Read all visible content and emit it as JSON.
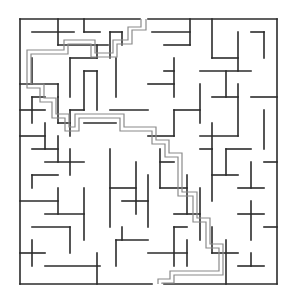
{
  "maze": {
    "colors": {
      "wall": "#2b2b2b",
      "solution_path": "#8a8a8a",
      "background": "#ffffff"
    },
    "bounds": {
      "left": 20,
      "top": 19,
      "right": 277,
      "bottom": 284
    },
    "entrance": {
      "side": "top",
      "x": 144
    },
    "exit": {
      "side": "bottom",
      "x": 158
    },
    "walls": [
      [
        20,
        19,
        140,
        19
      ],
      [
        148,
        19,
        277,
        19
      ],
      [
        20,
        19,
        20,
        284
      ],
      [
        277,
        19,
        277,
        284
      ],
      [
        20,
        284,
        152,
        284
      ],
      [
        164,
        284,
        277,
        284
      ],
      [
        32,
        32,
        74,
        32
      ],
      [
        58,
        19,
        58,
        45
      ],
      [
        84,
        19,
        84,
        32
      ],
      [
        84,
        32,
        100,
        32
      ],
      [
        110,
        32,
        110,
        58
      ],
      [
        110,
        32,
        122,
        32
      ],
      [
        122,
        32,
        122,
        45
      ],
      [
        58,
        45,
        108,
        45
      ],
      [
        97,
        45,
        97,
        58
      ],
      [
        70,
        58,
        97,
        58
      ],
      [
        70,
        58,
        70,
        97
      ],
      [
        20,
        84,
        58,
        84
      ],
      [
        58,
        84,
        58,
        97
      ],
      [
        32,
        58,
        32,
        84
      ],
      [
        84,
        71,
        84,
        110
      ],
      [
        84,
        71,
        97,
        71
      ],
      [
        97,
        71,
        97,
        110
      ],
      [
        116,
        58,
        116,
        97
      ],
      [
        20,
        110,
        45,
        110
      ],
      [
        32,
        97,
        45,
        97
      ],
      [
        32,
        97,
        32,
        123
      ],
      [
        58,
        97,
        58,
        123
      ],
      [
        58,
        123,
        70,
        123
      ],
      [
        70,
        110,
        70,
        136
      ],
      [
        70,
        110,
        84,
        110
      ],
      [
        45,
        123,
        45,
        149
      ],
      [
        20,
        136,
        45,
        136
      ],
      [
        32,
        149,
        58,
        149
      ],
      [
        58,
        136,
        58,
        162
      ],
      [
        84,
        123,
        116,
        123
      ],
      [
        110,
        110,
        148,
        110
      ],
      [
        45,
        162,
        84,
        162
      ],
      [
        70,
        149,
        70,
        175
      ],
      [
        32,
        175,
        58,
        175
      ],
      [
        32,
        175,
        32,
        188
      ],
      [
        20,
        201,
        58,
        201
      ],
      [
        58,
        188,
        58,
        214
      ],
      [
        45,
        214,
        84,
        214
      ],
      [
        84,
        188,
        84,
        240
      ],
      [
        32,
        227,
        70,
        227
      ],
      [
        70,
        227,
        70,
        253
      ],
      [
        20,
        253,
        45,
        253
      ],
      [
        32,
        240,
        32,
        266
      ],
      [
        45,
        266,
        100,
        266
      ],
      [
        97,
        253,
        97,
        284
      ],
      [
        116,
        240,
        116,
        266
      ],
      [
        116,
        240,
        148,
        240
      ],
      [
        122,
        227,
        122,
        240
      ],
      [
        110,
        149,
        110,
        227
      ],
      [
        110,
        188,
        136,
        188
      ],
      [
        136,
        162,
        136,
        214
      ],
      [
        122,
        201,
        148,
        201
      ],
      [
        148,
        175,
        148,
        227
      ],
      [
        160,
        162,
        174,
        162
      ],
      [
        160,
        149,
        160,
        188
      ],
      [
        160,
        188,
        187,
        188
      ],
      [
        187,
        175,
        187,
        214
      ],
      [
        174,
        214,
        200,
        214
      ],
      [
        200,
        188,
        200,
        240
      ],
      [
        174,
        227,
        187,
        227
      ],
      [
        174,
        227,
        174,
        266
      ],
      [
        148,
        253,
        187,
        253
      ],
      [
        187,
        240,
        187,
        266
      ],
      [
        212,
        227,
        212,
        253
      ],
      [
        212,
        253,
        238,
        253
      ],
      [
        226,
        240,
        226,
        284
      ],
      [
        238,
        214,
        264,
        214
      ],
      [
        251,
        201,
        251,
        240
      ],
      [
        264,
        227,
        277,
        227
      ],
      [
        238,
        266,
        264,
        266
      ],
      [
        251,
        253,
        251,
        266
      ],
      [
        152,
        32,
        190,
        32
      ],
      [
        190,
        19,
        190,
        45
      ],
      [
        164,
        45,
        190,
        45
      ],
      [
        212,
        19,
        212,
        58
      ],
      [
        212,
        58,
        238,
        58
      ],
      [
        238,
        32,
        238,
        71
      ],
      [
        251,
        32,
        264,
        32
      ],
      [
        264,
        32,
        264,
        58
      ],
      [
        200,
        71,
        251,
        71
      ],
      [
        226,
        71,
        226,
        97
      ],
      [
        164,
        71,
        174,
        71
      ],
      [
        174,
        58,
        174,
        97
      ],
      [
        148,
        84,
        174,
        84
      ],
      [
        200,
        84,
        200,
        123
      ],
      [
        212,
        97,
        238,
        97
      ],
      [
        238,
        84,
        238,
        136
      ],
      [
        251,
        97,
        277,
        97
      ],
      [
        264,
        110,
        264,
        149
      ],
      [
        200,
        136,
        238,
        136
      ],
      [
        212,
        123,
        212,
        149
      ],
      [
        174,
        110,
        200,
        110
      ],
      [
        174,
        110,
        174,
        136
      ],
      [
        148,
        136,
        174,
        136
      ],
      [
        226,
        149,
        251,
        149
      ],
      [
        226,
        149,
        226,
        175
      ],
      [
        212,
        175,
        238,
        175
      ],
      [
        251,
        162,
        251,
        188
      ],
      [
        238,
        188,
        264,
        188
      ],
      [
        264,
        162,
        277,
        162
      ],
      [
        200,
        149,
        212,
        149
      ],
      [
        212,
        149,
        212,
        201
      ]
    ],
    "solution_path": [
      [
        [
          141,
          19
        ],
        [
          141,
          27
        ],
        [
          128,
          27
        ],
        [
          128,
          40
        ],
        [
          113,
          40
        ],
        [
          113,
          53
        ],
        [
          95,
          53
        ],
        [
          95,
          40
        ],
        [
          64,
          40
        ],
        [
          64,
          50
        ],
        [
          27,
          50
        ],
        [
          27,
          88
        ],
        [
          40,
          88
        ],
        [
          40,
          102
        ],
        [
          52,
          102
        ],
        [
          52,
          118
        ],
        [
          65,
          118
        ],
        [
          65,
          131
        ],
        [
          79,
          131
        ],
        [
          79,
          118
        ],
        [
          120,
          118
        ],
        [
          120,
          131
        ],
        [
          152,
          131
        ],
        [
          152,
          144
        ],
        [
          165,
          144
        ],
        [
          165,
          157
        ],
        [
          178,
          157
        ],
        [
          178,
          196
        ],
        [
          193,
          196
        ],
        [
          193,
          222
        ],
        [
          206,
          222
        ],
        [
          206,
          248
        ],
        [
          219,
          248
        ],
        [
          219,
          271
        ],
        [
          170,
          271
        ],
        [
          170,
          279
        ],
        [
          158,
          279
        ],
        [
          158,
          284
        ]
      ],
      [
        [
          146,
          19
        ],
        [
          146,
          30
        ],
        [
          132,
          30
        ],
        [
          132,
          44
        ],
        [
          117,
          44
        ],
        [
          117,
          57
        ],
        [
          91,
          57
        ],
        [
          91,
          44
        ],
        [
          68,
          44
        ],
        [
          68,
          54
        ],
        [
          31,
          54
        ],
        [
          31,
          84
        ],
        [
          44,
          84
        ],
        [
          44,
          98
        ],
        [
          56,
          98
        ],
        [
          56,
          114
        ],
        [
          69,
          114
        ],
        [
          69,
          127
        ],
        [
          75,
          127
        ],
        [
          75,
          114
        ],
        [
          124,
          114
        ],
        [
          124,
          127
        ],
        [
          156,
          127
        ],
        [
          156,
          140
        ],
        [
          169,
          140
        ],
        [
          169,
          153
        ],
        [
          182,
          153
        ],
        [
          182,
          192
        ],
        [
          197,
          192
        ],
        [
          197,
          218
        ],
        [
          210,
          218
        ],
        [
          210,
          244
        ],
        [
          223,
          244
        ],
        [
          223,
          275
        ],
        [
          174,
          275
        ],
        [
          174,
          283
        ],
        [
          162,
          283
        ],
        [
          162,
          284
        ]
      ]
    ]
  }
}
